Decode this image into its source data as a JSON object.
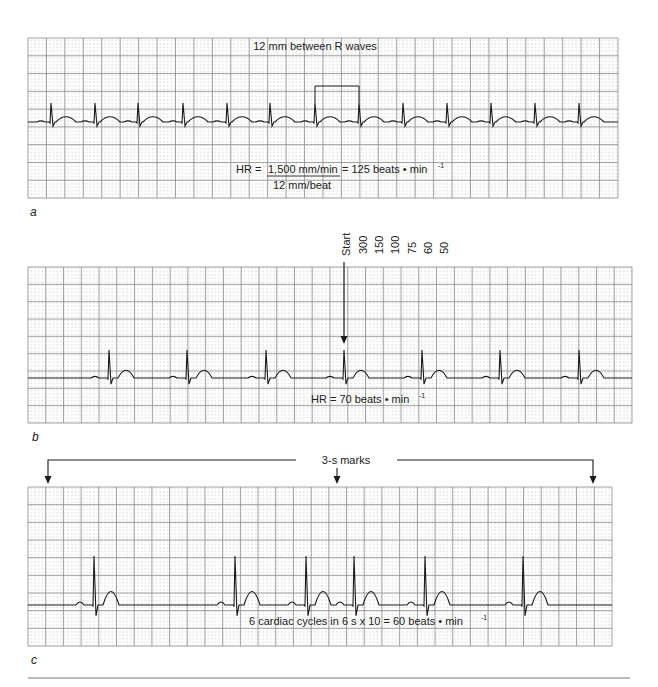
{
  "figure": {
    "panels": [
      {
        "id": "a",
        "letter": "a",
        "annotation_top": "12 mm between R waves",
        "formula": {
          "lhs": "HR =",
          "numerator": "1,500 mm/min",
          "rhs": "= 125 beats • min",
          "rhs_sup": "-1",
          "denominator": "12 mm/beat"
        },
        "grid": {
          "x0": 28,
          "y0": 38,
          "x1": 618,
          "y1": 198,
          "cols": 32,
          "rows": 9
        },
        "baseline_y": 122,
        "r_peak_y": 103,
        "r_waves_x": [
          51,
          95,
          138,
          183,
          227,
          270,
          315,
          359,
          403,
          447,
          491,
          535,
          579
        ],
        "bracket": {
          "x_start": 315,
          "x_end": 359,
          "y": 86
        }
      },
      {
        "id": "b",
        "letter": "b",
        "scale_labels": [
          "Start",
          "300",
          "150",
          "100",
          "75",
          "60",
          "50"
        ],
        "annotation_bottom": "HR = 70 beats • min",
        "annotation_bottom_sup": "-1",
        "grid": {
          "x0": 28,
          "y0": 267,
          "x1": 632,
          "y1": 423,
          "cols": 34,
          "rows": 9
        },
        "baseline_y": 378,
        "r_peak_y": 350,
        "r_waves_x": [
          109,
          187,
          266,
          344,
          422,
          500,
          579
        ],
        "start_arrow_x": 344
      },
      {
        "id": "c",
        "letter": "c",
        "annotation_top": "3-s marks",
        "annotation_bottom": "6 cardiac cycles in 6 s x 10 = 60 beats • min",
        "annotation_bottom_sup": "-1",
        "grid": {
          "x0": 28,
          "y0": 487,
          "x1": 612,
          "y1": 646,
          "cols": 33,
          "rows": 9
        },
        "baseline_y": 605,
        "r_peak_y": 556,
        "r_waves_x": [
          94,
          235,
          306,
          354,
          425,
          523
        ],
        "mark_arrows_x": [
          48,
          337,
          593
        ]
      }
    ],
    "colors": {
      "grid_major": "#8a8a8a",
      "grid_dot": "#a0a0a0",
      "trace": "#1a1a1a",
      "text": "#222222"
    }
  }
}
